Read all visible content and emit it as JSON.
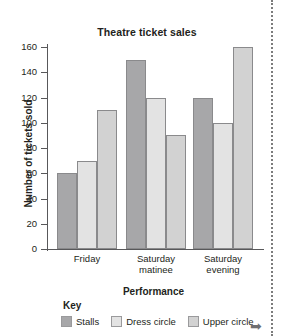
{
  "chart_data": {
    "type": "bar",
    "title": "Theatre ticket sales",
    "xlabel": "Performance",
    "ylabel": "Number of tickets sold",
    "categories": [
      "Friday",
      "Saturday matinee",
      "Saturday evening"
    ],
    "category_lines": [
      [
        "Friday"
      ],
      [
        "Saturday",
        "matinee"
      ],
      [
        "Saturday",
        "evening"
      ]
    ],
    "series": [
      {
        "name": "Stalls",
        "values": [
          60,
          150,
          120
        ],
        "color": "#a7a7a9"
      },
      {
        "name": "Dress circle",
        "values": [
          70,
          120,
          100
        ],
        "color": "#e3e3e3"
      },
      {
        "name": "Upper circle",
        "values": [
          110,
          90,
          160
        ],
        "color": "#d2d2d2"
      }
    ],
    "ylim": [
      0,
      160
    ],
    "yticks": [
      0,
      20,
      40,
      60,
      80,
      100,
      120,
      140,
      160
    ],
    "ytick_labels": [
      "0",
      "20",
      "40",
      "60",
      "80",
      "100",
      "120",
      "140",
      "160"
    ],
    "grid": false,
    "legend_position": "bottom",
    "legend_title": "Key"
  },
  "annotations": {
    "arrow_glyph": "➡"
  }
}
